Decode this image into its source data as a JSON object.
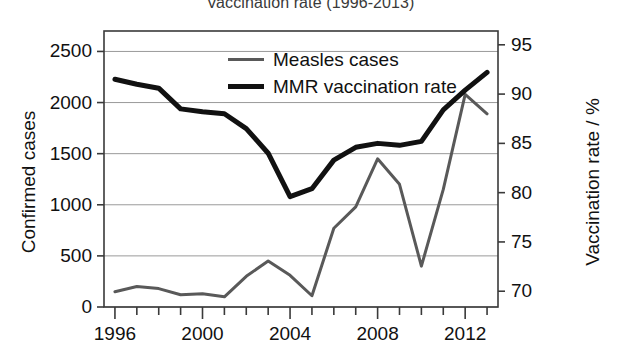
{
  "chart_data": {
    "type": "line",
    "title": "Vaccination rate (1996-2013)",
    "xlabel": "",
    "ylabel": "Confirmed cases",
    "y2label": "Vaccination rate / %",
    "grid": true,
    "legend_position": "top-center",
    "x": [
      1996,
      1997,
      1998,
      1999,
      2000,
      2001,
      2002,
      2003,
      2004,
      2005,
      2006,
      2007,
      2008,
      2009,
      2010,
      2011,
      2012,
      2013
    ],
    "xlim": [
      1995.5,
      2013.5
    ],
    "xticks_major": [
      1996,
      2000,
      2004,
      2008,
      2012
    ],
    "xtick_labels": [
      "1996",
      "2000",
      "2004",
      "2008",
      "2012"
    ],
    "xticks_minor_every": 1,
    "ylim": [
      0,
      2700
    ],
    "yticks": [
      0,
      500,
      1000,
      1500,
      2000,
      2500
    ],
    "ytick_labels": [
      "0",
      "500",
      "1000",
      "1500",
      "2000",
      "2500"
    ],
    "y2lim": [
      68.4,
      96.4
    ],
    "y2ticks": [
      70,
      75,
      80,
      85,
      90,
      95
    ],
    "y2tick_labels": [
      "70",
      "75",
      "80",
      "85",
      "90",
      "95"
    ],
    "series": [
      {
        "name": "Measles cases",
        "axis": "left",
        "color": "#595959",
        "width": 3,
        "values": [
          150,
          200,
          180,
          120,
          130,
          100,
          300,
          450,
          310,
          110,
          770,
          980,
          1450,
          1200,
          400,
          1150,
          2080,
          1890
        ]
      },
      {
        "name": "MMR vaccination rate",
        "axis": "right",
        "color": "#111111",
        "width": 5,
        "values": [
          91.5,
          91.0,
          90.6,
          88.5,
          88.2,
          88.0,
          86.5,
          84.0,
          79.6,
          80.4,
          83.3,
          84.6,
          85.0,
          84.8,
          85.2,
          88.4,
          90.4,
          92.2
        ]
      }
    ]
  },
  "legend": {
    "items": [
      {
        "label": "Measles cases",
        "color": "#595959",
        "thickness": "3px"
      },
      {
        "label": "MMR vaccination rate",
        "color": "#111111",
        "thickness": "5px"
      }
    ]
  },
  "axes": {
    "left_title": "Confirmed cases",
    "right_title": "Vaccination rate / %"
  }
}
